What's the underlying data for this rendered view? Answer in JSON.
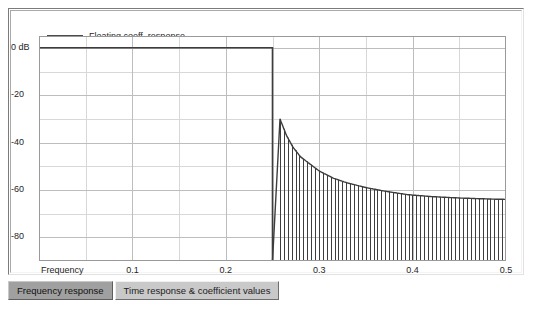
{
  "window": {
    "background_color": "#ffffff"
  },
  "panel": {
    "name": "frequency-response-plot-panel"
  },
  "legend": {
    "entries": [
      {
        "label": "Floating coeff. response",
        "color": "#4a4a4a"
      }
    ],
    "position": "top-left-inside"
  },
  "tabs": {
    "items": [
      {
        "label": "Frequency response",
        "selected": true
      },
      {
        "label": "Time response & coefficient values",
        "selected": false
      }
    ]
  },
  "chart_data": {
    "type": "line",
    "title": "",
    "subtitle": "",
    "xlabel": "Frequency",
    "ylabel": "",
    "xlim": [
      0.0,
      0.5
    ],
    "ylim": [
      -90,
      5
    ],
    "grid": true,
    "grid_color": "#c8c8c8",
    "legend_position": "top-left",
    "x_axis_label_text": "Frequency",
    "xticks": [
      0.0,
      0.1,
      0.2,
      0.3,
      0.4,
      0.5
    ],
    "xticklabels": [
      "Frequency",
      "0.1",
      "0.2",
      "0.3",
      "0.4",
      "0.5"
    ],
    "x_minor_gridlines": [
      0.05,
      0.15,
      0.25,
      0.35,
      0.45
    ],
    "yticks": [
      0,
      -20,
      -40,
      -60,
      -80
    ],
    "yticklabels": [
      "0 dB",
      "-20",
      "-40",
      "-60",
      "-80"
    ],
    "y_minor_gridlines": [
      -10,
      -30,
      -50,
      -70
    ],
    "series": [
      {
        "name": "Floating coeff. response",
        "color": "#3d3d3d",
        "description": "Lowpass FIR magnitude response: flat 0 dB passband to f=0.25, sharp transition, equiripple-like stopband with dense nulls decaying from about -30 dB to a floor near -64 dB",
        "passband_level_db": 0,
        "cutoff_frequency": 0.25,
        "transition_end_frequency": 0.258,
        "stopband_envelope": [
          {
            "f": 0.258,
            "peak_db": -30
          },
          {
            "f": 0.265,
            "peak_db": -37
          },
          {
            "f": 0.272,
            "peak_db": -42
          },
          {
            "f": 0.28,
            "peak_db": -46
          },
          {
            "f": 0.29,
            "peak_db": -49
          },
          {
            "f": 0.3,
            "peak_db": -52
          },
          {
            "f": 0.315,
            "peak_db": -55
          },
          {
            "f": 0.33,
            "peak_db": -57
          },
          {
            "f": 0.35,
            "peak_db": -59
          },
          {
            "f": 0.37,
            "peak_db": -60.5
          },
          {
            "f": 0.395,
            "peak_db": -62
          },
          {
            "f": 0.42,
            "peak_db": -62.8
          },
          {
            "f": 0.45,
            "peak_db": -63.4
          },
          {
            "f": 0.48,
            "peak_db": -63.8
          },
          {
            "f": 0.5,
            "peak_db": -64
          }
        ],
        "stopband_null_depth_db": -90,
        "stopband_ripple_count": 58
      }
    ]
  }
}
